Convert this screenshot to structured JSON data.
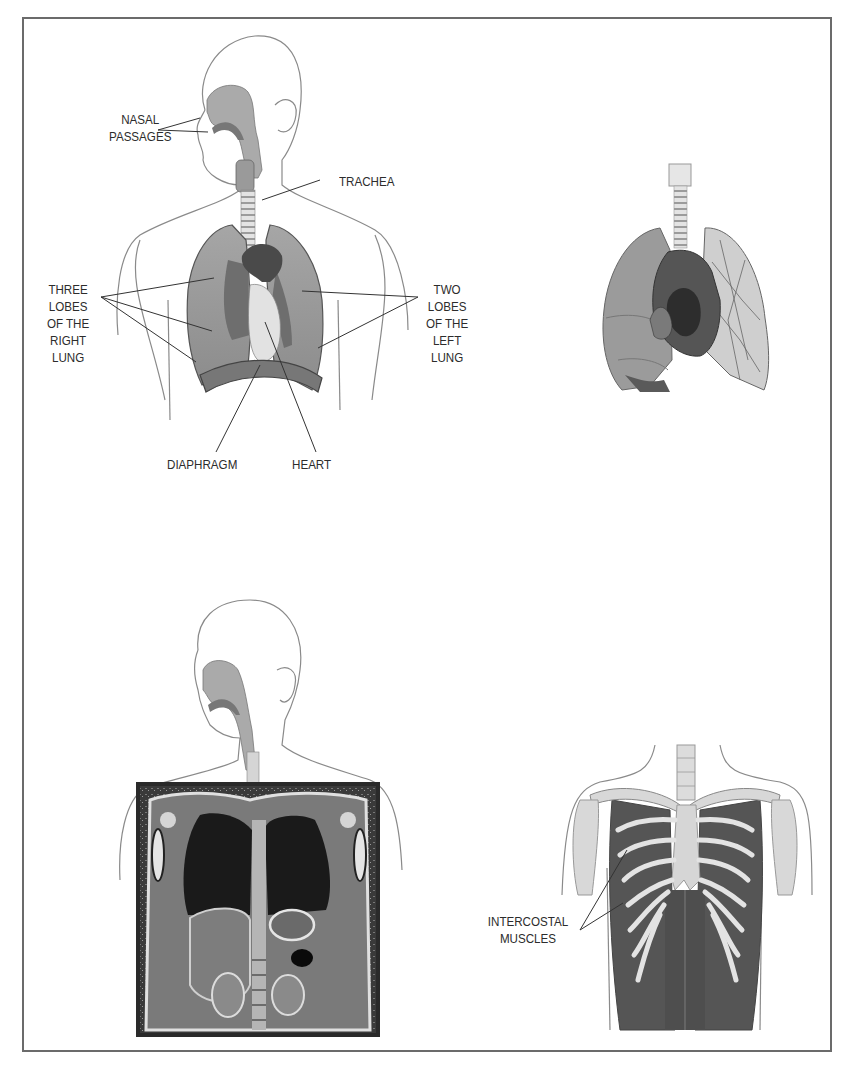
{
  "figure": {
    "panels": [
      {
        "id": "respiratory-system-overview",
        "description": "Human head and torso outline showing airway, lungs, heart and diaphragm",
        "labels": {
          "nasal_passages": [
            "NASAL",
            "PASSAGES"
          ],
          "trachea": [
            "TRACHEA"
          ],
          "three_lobes_right_lung": [
            "THREE",
            "LOBES",
            "OF THE",
            "RIGHT",
            "LUNG"
          ],
          "two_lobes_left_lung": [
            "TWO",
            "LOBES",
            "OF THE",
            "LEFT",
            "LUNG"
          ],
          "diaphragm": [
            "DIAPHRAGM"
          ],
          "heart": [
            "HEART"
          ]
        }
      },
      {
        "id": "lungs-and-heart-cutaway",
        "description": "Isolated lungs with trachea and sectioned heart, left lung showing bronchial tree"
      },
      {
        "id": "mri-overlay",
        "description": "Head outline with airway above a coronal chest MRI scan"
      },
      {
        "id": "intercostal-muscles",
        "description": "Rib cage with shoulder girdle and intercostal muscles",
        "labels": {
          "intercostal_muscles": [
            "INTERCOSTAL",
            "MUSCLES"
          ]
        }
      }
    ],
    "colors": {
      "frame": "#6b6b6b",
      "outline": "#8a8a8a",
      "lung": "#9a9a9a",
      "lung_dark": "#6e6e6e",
      "heart": "#4a4a4a",
      "muscle": "#5a5a5a",
      "bone": "#d8d8d8",
      "text": "#2c2c2c"
    }
  }
}
